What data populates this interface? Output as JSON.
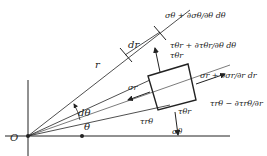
{
  "diagram": {
    "origin": "O",
    "radius_label": "r",
    "dr_label": "dr",
    "theta_label": "θ",
    "dtheta_label": "dθ",
    "stresses": {
      "sigma_theta_plus": "σθ + ∂σθ/∂θ dθ",
      "tau_theta_r_plus": "τθr + ∂τθr/∂θ dθ",
      "sigma_r_plus": "σr + ∂σr/∂r dr",
      "tau_r_theta_minus": "τrθ − ∂τrθ/∂r",
      "sigma_r": "σr",
      "tau_r_theta": "τrθ",
      "tau_theta_r": "τθr",
      "tau_theta_r_top": "τθr",
      "sigma_theta": "σθ"
    }
  }
}
